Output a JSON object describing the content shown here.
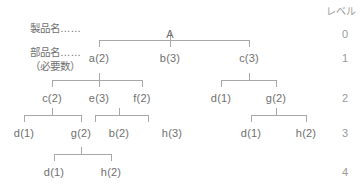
{
  "diagram": {
    "title_row_labels": {
      "product": "製品名……",
      "part": "部品名……",
      "quantity": "（必要数）"
    },
    "level_column": {
      "header": "レベル",
      "values": [
        "0",
        "1",
        "2",
        "3",
        "4"
      ]
    },
    "colors": {
      "text": "#6f6f6f",
      "line": "#a8a8a8",
      "level_text": "#9a9a9a",
      "background": "#ffffff"
    },
    "nodes": [
      {
        "id": "n0",
        "label": "A",
        "level": 0,
        "x": 170,
        "y": 28
      },
      {
        "id": "n1a",
        "label": "a(2)",
        "level": 1,
        "x": 99,
        "y": 52
      },
      {
        "id": "n1b",
        "label": "b(3)",
        "level": 1,
        "x": 170,
        "y": 52
      },
      {
        "id": "n1c",
        "label": "c(3)",
        "level": 1,
        "x": 249,
        "y": 52
      },
      {
        "id": "n2a",
        "label": "c(2)",
        "level": 2,
        "x": 52,
        "y": 92
      },
      {
        "id": "n2b",
        "label": "e(3)",
        "level": 2,
        "x": 99,
        "y": 92
      },
      {
        "id": "n2c",
        "label": "f(2)",
        "level": 2,
        "x": 142,
        "y": 92
      },
      {
        "id": "n2d",
        "label": "d(1)",
        "level": 2,
        "x": 221,
        "y": 92
      },
      {
        "id": "n2e",
        "label": "g(2)",
        "level": 2,
        "x": 276,
        "y": 92
      },
      {
        "id": "n3a",
        "label": "d(1)",
        "level": 3,
        "x": 24,
        "y": 127
      },
      {
        "id": "n3b",
        "label": "g(2)",
        "level": 3,
        "x": 81,
        "y": 127
      },
      {
        "id": "n3c",
        "label": "b(2)",
        "level": 3,
        "x": 119,
        "y": 127
      },
      {
        "id": "n3d",
        "label": "h(3)",
        "level": 3,
        "x": 172,
        "y": 127
      },
      {
        "id": "n3e",
        "label": "d(1)",
        "level": 3,
        "x": 251,
        "y": 127
      },
      {
        "id": "n3f",
        "label": "h(2)",
        "level": 3,
        "x": 306,
        "y": 127
      },
      {
        "id": "n4a",
        "label": "d(1)",
        "level": 4,
        "x": 54,
        "y": 166
      },
      {
        "id": "n4b",
        "label": "h(2)",
        "level": 4,
        "x": 111,
        "y": 166
      }
    ],
    "connectors": [
      {
        "id": "c0",
        "parent_x": 170,
        "bar_y": 40,
        "bar_left": 99,
        "bar_right": 249,
        "stub_top": 33,
        "children_x": [
          99,
          170,
          249
        ]
      },
      {
        "id": "c1a",
        "parent_x": 99,
        "bar_y": 80,
        "bar_left": 52,
        "bar_right": 142,
        "stub_top": 73,
        "children_x": [
          52,
          99,
          142
        ]
      },
      {
        "id": "c1c",
        "parent_x": 249,
        "bar_y": 80,
        "bar_left": 221,
        "bar_right": 276,
        "stub_top": 73,
        "children_x": [
          221,
          276
        ]
      },
      {
        "id": "c2a",
        "parent_x": 52,
        "bar_y": 115,
        "bar_left": 24,
        "bar_right": 81,
        "stub_top": 108,
        "children_x": [
          24,
          81
        ]
      },
      {
        "id": "c2b",
        "parent_x": 119,
        "bar_y": 115,
        "bar_left": 95,
        "bar_right": 148,
        "stub_top": 108,
        "children_x": [
          95,
          148
        ]
      },
      {
        "id": "c2e",
        "parent_x": 276,
        "bar_y": 115,
        "bar_left": 251,
        "bar_right": 306,
        "stub_top": 108,
        "children_x": [
          251,
          306
        ]
      },
      {
        "id": "c3b",
        "parent_x": 81,
        "bar_y": 154,
        "bar_left": 54,
        "bar_right": 111,
        "stub_top": 147,
        "children_x": [
          54,
          111
        ]
      }
    ],
    "level_rows": [
      {
        "level": "0",
        "y": 28
      },
      {
        "level": "1",
        "y": 52
      },
      {
        "level": "2",
        "y": 92
      },
      {
        "level": "3",
        "y": 127
      },
      {
        "level": "4",
        "y": 166
      }
    ]
  }
}
